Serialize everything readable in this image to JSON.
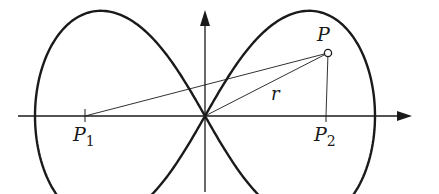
{
  "diagram": {
    "type": "lemniscate-of-bernoulli",
    "labels": {
      "point_P": "P",
      "focus_1": "P",
      "focus_1_sub": "1",
      "focus_2": "P",
      "focus_2_sub": "2",
      "radius": "r"
    },
    "colors": {
      "stroke": "#1a1a1a",
      "background": "#ffffff"
    },
    "geometry": {
      "origin": [
        205,
        116
      ],
      "half_width": 170,
      "foci_offset": 120,
      "point_P": [
        328,
        53
      ]
    }
  }
}
